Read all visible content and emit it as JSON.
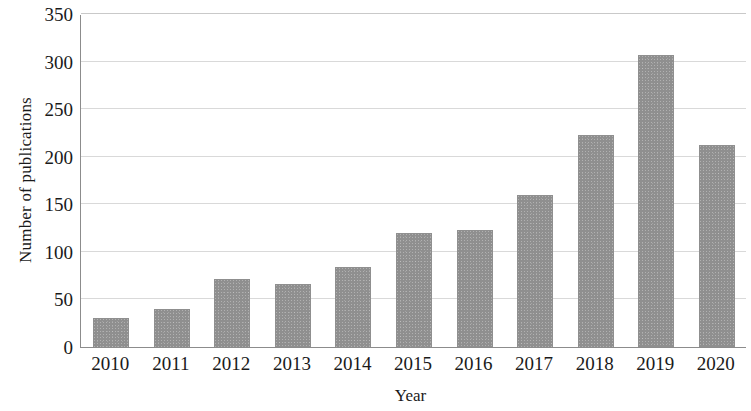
{
  "chart_data": {
    "type": "bar",
    "title": "",
    "xlabel": "Year",
    "ylabel": "Number of publications",
    "categories": [
      "2010",
      "2011",
      "2012",
      "2013",
      "2014",
      "2015",
      "2016",
      "2017",
      "2018",
      "2019",
      "2020"
    ],
    "values": [
      31,
      40,
      71,
      66,
      84,
      120,
      123,
      160,
      223,
      307,
      212
    ],
    "ylim": [
      0,
      350
    ],
    "yticks": [
      0,
      50,
      100,
      150,
      200,
      250,
      300,
      350
    ],
    "ytick_labels": [
      "0",
      "50",
      "100",
      "150",
      "200",
      "250",
      "300",
      "350"
    ],
    "grid": true,
    "grid_axis": "y",
    "legend": false,
    "bar_color": "#8f8f8f",
    "grid_color": "#d9d9d9",
    "axis_color": "#8c8c8c",
    "background_color": "#ffffff"
  }
}
